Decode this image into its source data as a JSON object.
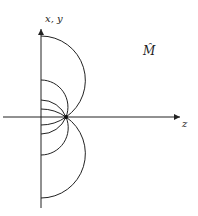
{
  "diagram": {
    "vertical_axis_label": "x, y",
    "horizontal_axis_label": "z",
    "region_label": "M̂",
    "arc_count": 8,
    "colors": {
      "stroke": "#222222",
      "background": "#ffffff"
    }
  }
}
